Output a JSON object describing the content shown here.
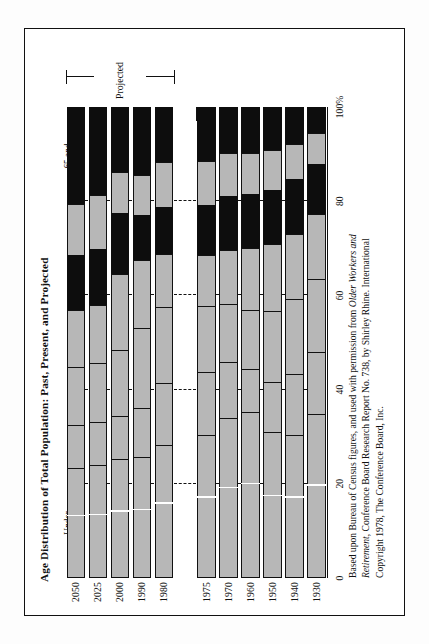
{
  "figure": {
    "title": "Age Distribution of Total Population: Past, Present, and Projected",
    "caption_line1_a": "Based upon Bureau of Census figures, and used with permission from ",
    "caption_line1_b": "Older Workers and",
    "caption_line2_a": "Retirement",
    "caption_line2_b": ", Conference Board Research Report No. 738, by Shirley Rhine. International",
    "caption_line3": "Copyright 1978, The Conference Board, Inc.",
    "projected_label": "Projected",
    "colors": {
      "dark": "#0d0d0d",
      "light": "#b7b7b7",
      "ink": "#111111",
      "paper": "#ffffff"
    }
  },
  "chart_data": {
    "type": "bar",
    "orientation": "horizontal-stacked",
    "title": "Age Distribution of Total Population: Past, Present, and Projected",
    "xlabel": "",
    "ylabel": "",
    "xlim": [
      0,
      100
    ],
    "grid": false,
    "legend_position": "top-inline",
    "tick_labels": [
      "0",
      "20",
      "40",
      "60",
      "80",
      "100%"
    ],
    "tick_values": [
      0,
      20,
      40,
      60,
      80,
      100
    ],
    "categories": [
      "1930",
      "1940",
      "1950",
      "1960",
      "1970",
      "1975",
      "1980",
      "1990",
      "2000",
      "2025",
      "2050"
    ],
    "projected_categories": [
      "1980",
      "1990",
      "2000",
      "2025",
      "2050"
    ],
    "series": [
      {
        "name": "Under 18 years",
        "shade": "light",
        "values": [
          35.0,
          30.5,
          31.0,
          35.5,
          34.2,
          30.5,
          28.2,
          25.8,
          25.2,
          24.0,
          23.4
        ]
      },
      {
        "name": "18-24",
        "shade": "light",
        "values": [
          13.2,
          13.0,
          10.6,
          9.0,
          11.9,
          13.3,
          13.2,
          10.2,
          9.2,
          9.0,
          9.0
        ]
      },
      {
        "name": "25-34",
        "shade": "light",
        "values": [
          15.5,
          15.8,
          15.2,
          12.6,
          12.3,
          14.0,
          16.2,
          17.2,
          13.9,
          12.5,
          12.4
        ]
      },
      {
        "name": "35-44",
        "shade": "light",
        "values": [
          13.8,
          14.0,
          14.2,
          13.2,
          11.4,
          10.9,
          11.3,
          14.3,
          16.2,
          12.4,
          12.0
        ]
      },
      {
        "name": "45-54",
        "shade": "dark",
        "values": [
          10.6,
          11.5,
          11.5,
          11.3,
          11.4,
          10.6,
          9.9,
          9.6,
          13.1,
          11.8,
          11.6
        ]
      },
      {
        "name": "55-64",
        "shade": "light",
        "values": [
          6.5,
          7.5,
          8.5,
          8.6,
          9.1,
          9.3,
          9.6,
          8.5,
          8.6,
          11.6,
          10.8
        ]
      },
      {
        "name": "65 and over",
        "shade": "dark",
        "values": [
          5.4,
          7.7,
          9.0,
          9.8,
          9.7,
          11.4,
          11.6,
          14.4,
          13.8,
          18.7,
          20.8
        ]
      }
    ],
    "age_group_labels": [
      {
        "label_line1": "Under",
        "label_line2": "18 years",
        "series": "Under 18 years"
      },
      {
        "label_line1": "18–24",
        "label_line2": "",
        "series": "18-24"
      },
      {
        "label_line1": "25–34",
        "label_line2": "",
        "series": "25-34"
      },
      {
        "label_line1": "35–44",
        "label_line2": "",
        "series": "35-44"
      },
      {
        "label_line1": "45–54",
        "label_line2": "",
        "series": "45-54"
      },
      {
        "label_line1": "55–64",
        "label_line2": "",
        "series": "55-64"
      },
      {
        "label_line1": "65 and",
        "label_line2": "over",
        "series": "65 and over"
      }
    ]
  }
}
